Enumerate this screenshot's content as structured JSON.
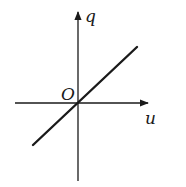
{
  "diagram": {
    "title": "",
    "type": "q-u linear graph through origin",
    "axes": {
      "x_label": "u",
      "y_label": "q",
      "origin_label": "O"
    },
    "line": {
      "description": "straight line through origin with positive slope",
      "from": [
        33,
        145
      ],
      "to": [
        137,
        47
      ]
    },
    "colors": {
      "ink": "#1a1a1a",
      "background": "#ffffff"
    }
  }
}
